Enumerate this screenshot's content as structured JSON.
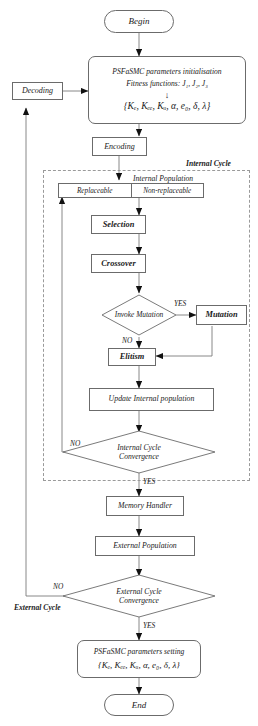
{
  "diagram": {
    "stroke_color": "#6b6b6b",
    "dash_color": "#9a9a9a",
    "text_color": "#1a1a1a"
  },
  "nodes": {
    "begin": "Begin",
    "end": "End",
    "decoding": "Decoding",
    "encoding": "Encoding",
    "init_line1": "PSFaSMC parameters initialisation",
    "init_line2": "Fitness functions: J₁, J₂, J₃",
    "init_arrow": "↓",
    "init_line3": "{Kₑ, Kₑₑ, Kᵤ, α, e₀, δ, λ}",
    "internal_population": "Internal Population",
    "replaceable": "Replaceable",
    "non_replaceable": "Non-replaceable",
    "selection": "Selection",
    "crossover": "Crossover",
    "invoke_mutation": "Invoke Mutation",
    "mutation": "Mutation",
    "elitism": "Elitism",
    "update_internal": "Update Internal population",
    "internal_conv_line1": "Internal Cycle",
    "internal_conv_line2": "Convergence",
    "memory_handler": "Memory Handler",
    "external_population": "External Population",
    "external_conv_line1": "External Cycle",
    "external_conv_line2": "Convergence",
    "setting_line1": "PSFaSMC parameters setting",
    "setting_line2": "{Kₑ, Kₑₑ, Kᵤ, α, e₀, δ, λ}"
  },
  "labels": {
    "internal_cycle": "Internal Cycle",
    "external_cycle": "External Cycle",
    "yes_mutation": "YES",
    "no_mutation": "NO",
    "no_internal": "NO",
    "yes_internal": "YES",
    "no_external": "NO",
    "yes_external": "YES"
  }
}
